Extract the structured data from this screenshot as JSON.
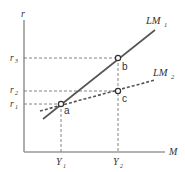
{
  "diagram": {
    "type": "LM curve shift diagram",
    "axes": {
      "y_label": "r",
      "x_label": "M"
    },
    "y_ticks": [
      {
        "label": "r",
        "sub": "3"
      },
      {
        "label": "r",
        "sub": "2"
      },
      {
        "label": "r",
        "sub": "1"
      }
    ],
    "x_ticks": [
      {
        "label": "Y",
        "sub": "1"
      },
      {
        "label": "Y",
        "sub": "2"
      }
    ],
    "curves": [
      {
        "label": "LM",
        "sub": "1",
        "style": "solid"
      },
      {
        "label": "LM",
        "sub": "2",
        "style": "dashed"
      }
    ],
    "points": [
      {
        "label": "a"
      },
      {
        "label": "b"
      },
      {
        "label": "c"
      }
    ],
    "colors": {
      "line": "#555555",
      "axis": "#888888",
      "text": "#333333"
    }
  }
}
